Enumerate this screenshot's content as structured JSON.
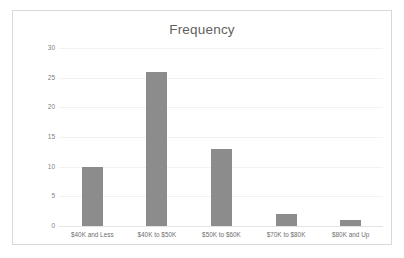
{
  "chart_data": {
    "type": "bar",
    "title": "Frequency",
    "xlabel": "",
    "ylabel": "",
    "categories": [
      "$40K and Less",
      "$40K to $50K",
      "$50K to $60K",
      "$70K to $80K",
      "$80K and Up"
    ],
    "values": [
      10,
      26,
      13,
      2,
      1
    ],
    "ylim": [
      0,
      30
    ],
    "ytick_labels": [
      "30",
      "25",
      "20",
      "15",
      "10",
      "5",
      "0"
    ],
    "ytick_values": [
      30,
      25,
      20,
      15,
      10,
      5,
      0
    ],
    "grid": true,
    "legend": false,
    "legend_position": "none",
    "bar_color": "#8c8c8c",
    "gridline_color": "#f2f2f2",
    "title_color": "#5f5f5f",
    "tick_color": "#7f7f7f",
    "border_color": "#d9d9d9",
    "background_color": "#ffffff"
  }
}
